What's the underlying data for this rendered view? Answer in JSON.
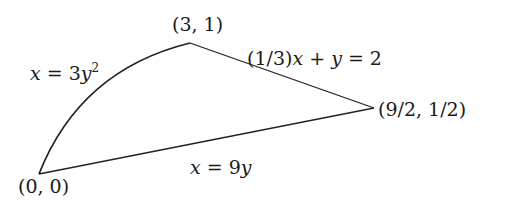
{
  "diagram": {
    "type": "region-bounded-by-curves",
    "stroke_color": "#222222",
    "background": "#ffffff",
    "vertices": [
      {
        "id": "origin",
        "label": "(0,0)",
        "x": 0,
        "y": 0
      },
      {
        "id": "top",
        "label": "(3,1)",
        "x": 3,
        "y": 1
      },
      {
        "id": "right",
        "label": "(9/2,1/2)",
        "x": 4.5,
        "y": 0.5
      }
    ],
    "curves": [
      {
        "id": "parabola",
        "label": "x = 3y^2",
        "from": "origin",
        "to": "top",
        "kind": "curve"
      },
      {
        "id": "slant-line",
        "label": "(1/3)x + y = 2",
        "from": "top",
        "to": "right",
        "kind": "line"
      },
      {
        "id": "base-line",
        "label": "x = 9y",
        "from": "origin",
        "to": "right",
        "kind": "line"
      }
    ]
  },
  "labels": {
    "vertex_origin": "(0, 0)",
    "vertex_top": "(3, 1)",
    "vertex_right": "(9/2, 1/2)",
    "curve_parabola_lhs": "x",
    "curve_parabola_eq": " = 3",
    "curve_parabola_var": "y",
    "curve_parabola_exp": "2",
    "line_slant_coef": "(1/3)",
    "line_slant_x": "x",
    "line_slant_plus": " + ",
    "line_slant_y": "y",
    "line_slant_rhs": " = 2",
    "line_base_x": "x",
    "line_base_eq": " = 9",
    "line_base_y": "y"
  }
}
